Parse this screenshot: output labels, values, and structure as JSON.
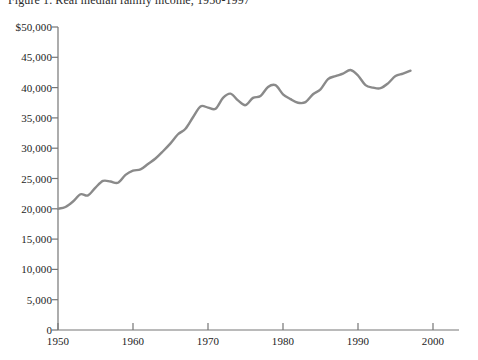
{
  "chart_data": {
    "type": "line",
    "title": "Figure 1. Real median family income, 1950-1997",
    "xlabel": "",
    "ylabel": "",
    "xlim": [
      1950,
      2000
    ],
    "ylim": [
      0,
      50000
    ],
    "grid": false,
    "legend": "none",
    "line_color": "#8a8a8a",
    "xticks": [
      1950,
      1960,
      1970,
      1980,
      1990,
      2000
    ],
    "xtick_labels": [
      "1950",
      "1960",
      "1970",
      "1980",
      "1990",
      "2000"
    ],
    "yticks": [
      0,
      5000,
      10000,
      15000,
      20000,
      25000,
      30000,
      35000,
      40000,
      45000,
      50000
    ],
    "ytick_labels": [
      "0",
      "5,000",
      "10,000",
      "15,000",
      "20,000",
      "25,000",
      "30,000",
      "35,000",
      "40,000",
      "45,000",
      "$50,000"
    ],
    "series": [
      {
        "name": "Real median family income",
        "x": [
          1950,
          1951,
          1952,
          1953,
          1954,
          1955,
          1956,
          1957,
          1958,
          1959,
          1960,
          1961,
          1962,
          1963,
          1964,
          1965,
          1966,
          1967,
          1968,
          1969,
          1970,
          1971,
          1972,
          1973,
          1974,
          1975,
          1976,
          1977,
          1978,
          1979,
          1980,
          1981,
          1982,
          1983,
          1984,
          1985,
          1986,
          1987,
          1988,
          1989,
          1990,
          1991,
          1992,
          1993,
          1994,
          1995,
          1996,
          1997
        ],
        "values": [
          20000,
          20300,
          21200,
          22400,
          22200,
          23500,
          24600,
          24500,
          24300,
          25600,
          26300,
          26500,
          27400,
          28300,
          29500,
          30800,
          32300,
          33200,
          35100,
          36900,
          36700,
          36500,
          38300,
          39000,
          37900,
          37100,
          38300,
          38600,
          40100,
          40400,
          38900,
          38100,
          37500,
          37600,
          38900,
          39700,
          41400,
          41900,
          42300,
          42900,
          42000,
          40400,
          40000,
          39900,
          40700,
          41900,
          42300,
          42800
        ]
      }
    ]
  }
}
